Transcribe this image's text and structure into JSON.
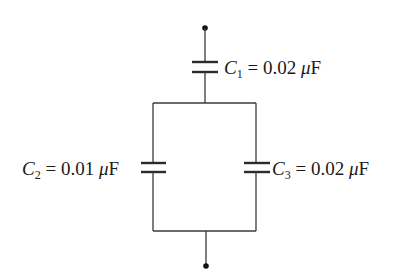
{
  "diagram": {
    "type": "capacitor-network",
    "colors": {
      "wire": "#3a3a3a",
      "background": "#ffffff",
      "text": "#1a1a1a"
    },
    "capacitors": [
      {
        "id": "C1",
        "symbol": "C",
        "subscript": "1",
        "equals": "=",
        "value": "0.02",
        "unit_prefix": "μ",
        "unit": "F",
        "position": "top series"
      },
      {
        "id": "C2",
        "symbol": "C",
        "subscript": "2",
        "equals": "=",
        "value": "0.01",
        "unit_prefix": "μ",
        "unit": "F",
        "position": "left parallel branch"
      },
      {
        "id": "C3",
        "symbol": "C",
        "subscript": "3",
        "equals": "=",
        "value": "0.02",
        "unit_prefix": "μ",
        "unit": "F",
        "position": "right parallel branch"
      }
    ],
    "terminals": [
      {
        "id": "top-terminal"
      },
      {
        "id": "bottom-terminal"
      }
    ]
  }
}
